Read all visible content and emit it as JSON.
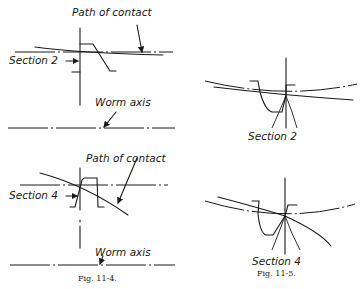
{
  "figures": [
    {
      "id": "fig-11-4",
      "caption": "Fig. 11-4.",
      "panels": [
        {
          "labels": {
            "path_of_contact": "Path of contact",
            "section": "Section 2",
            "worm_axis": "Worm axis"
          }
        },
        {
          "labels": {
            "path_of_contact": "Path of contact",
            "section": "Section 4",
            "worm_axis": "Worm axis"
          }
        }
      ]
    },
    {
      "id": "fig-11-5",
      "caption": "Fig. 11-5.",
      "panels": [
        {
          "labels": {
            "section": "Section 2"
          }
        },
        {
          "labels": {
            "section": "Section 4"
          }
        }
      ]
    }
  ],
  "colors": {
    "ink": "#1a1a1a",
    "paper": "#ffffff"
  }
}
